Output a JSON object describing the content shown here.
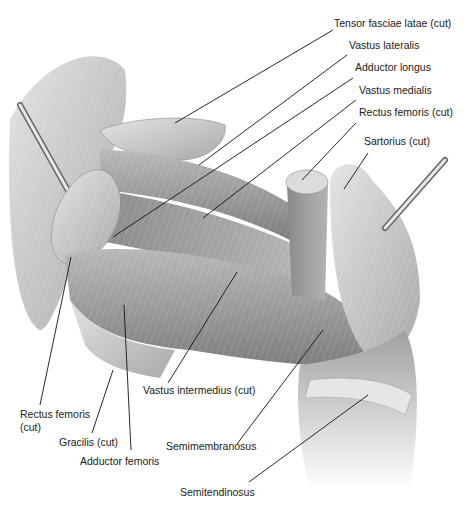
{
  "figure": {
    "style": "grayscale pencil",
    "colors": {
      "background": "#ffffff",
      "muscle_light": "#d8d8d8",
      "muscle_mid": "#a8a8a8",
      "muscle_dark": "#6e6e6e",
      "leader_line": "#111111",
      "label_text": "#1a1a1a"
    }
  },
  "labels": [
    {
      "id": "tensor-fasciae-latae",
      "text": "Tensor fasciae latae (cut)",
      "x": 334,
      "y": 23,
      "line": [
        333,
        30,
        175,
        123
      ]
    },
    {
      "id": "vastus-lateralis",
      "text": "Vastus lateralis",
      "x": 349,
      "y": 45,
      "line": [
        347,
        55,
        199,
        165
      ]
    },
    {
      "id": "adductor-longus",
      "text": "Adductor longus",
      "x": 355,
      "y": 67,
      "line": [
        353,
        78,
        113,
        237
      ]
    },
    {
      "id": "vastus-medialis",
      "text": "Vastus medialis",
      "x": 359,
      "y": 90,
      "line": [
        356,
        100,
        203,
        218
      ]
    },
    {
      "id": "rectus-femoris-cut-right",
      "text": "Rectus femoris (cut)",
      "x": 359,
      "y": 112,
      "line": [
        356,
        123,
        302,
        180
      ]
    },
    {
      "id": "sartorius",
      "text": "Sartorius (cut)",
      "x": 364,
      "y": 141,
      "line": [
        368,
        153,
        344,
        189
      ]
    },
    {
      "id": "vastus-intermedius",
      "text": "Vastus intermedius (cut)",
      "x": 143,
      "y": 389,
      "line": [
        168,
        383,
        237,
        272
      ]
    },
    {
      "id": "rectus-femoris-cut-left",
      "text": "Rectus femoris\n(cut)",
      "x": 20,
      "y": 406,
      "line": [
        40,
        405,
        71,
        257
      ]
    },
    {
      "id": "gracilis",
      "text": "Gracilis (cut)",
      "x": 59,
      "y": 435,
      "line": [
        92,
        433,
        113,
        370
      ]
    },
    {
      "id": "semimembranosus",
      "text": "Semimembranosus",
      "x": 166,
      "y": 438,
      "line": [
        237,
        444,
        323,
        330
      ]
    },
    {
      "id": "adductor-femoris",
      "text": "Adductor femoris",
      "x": 80,
      "y": 453,
      "line": [
        131,
        450,
        124,
        305
      ]
    },
    {
      "id": "semitendinosus",
      "text": "Semitendinosus",
      "x": 180,
      "y": 486,
      "line": [
        249,
        482,
        368,
        395
      ]
    }
  ]
}
